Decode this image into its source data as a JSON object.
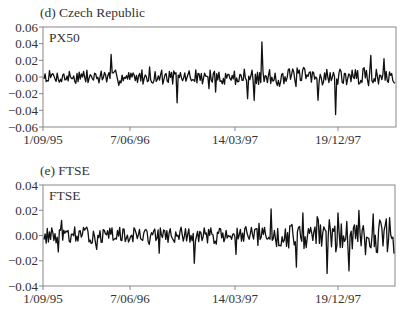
{
  "chart_data": [
    {
      "type": "line",
      "panel_title": "(d) Czech Republic",
      "series_label": "PX50",
      "xlabel": "",
      "ylabel": "",
      "x_tick_labels": [
        "1/09/95",
        "7/06/96",
        "14/03/97",
        "19/12/97"
      ],
      "y_tick_labels": [
        "0.06",
        "0.04",
        "0.02",
        "0.00",
        "−0.02",
        "−0.04",
        "−0.06"
      ],
      "ylim": [
        -0.06,
        0.06
      ],
      "x_range": [
        "1/09/95",
        "~08/1998"
      ],
      "grid": false,
      "legend": "inside top-left (series name)",
      "notes": "Daily returns series; mostly within ±0.015, spikes ~+0.027 (early 1996), ~-0.031 (mid 1996), ~+0.042 (mid 1997), ~-0.045 (early 1998)",
      "series": [
        {
          "name": "PX50",
          "amplitude": 0.008,
          "seed": 7,
          "spikes": [
            [
              0.19,
              0.027
            ],
            [
              0.38,
              -0.031
            ],
            [
              0.3,
              0.012
            ],
            [
              0.62,
              0.042
            ],
            [
              0.6,
              -0.028
            ],
            [
              0.58,
              -0.026
            ],
            [
              0.83,
              -0.045
            ],
            [
              0.78,
              -0.028
            ],
            [
              0.93,
              0.026
            ],
            [
              0.97,
              0.022
            ],
            [
              0.49,
              -0.018
            ],
            [
              0.47,
              -0.014
            ]
          ]
        }
      ]
    },
    {
      "type": "line",
      "panel_title": "(e) FTSE",
      "series_label": "FTSE",
      "xlabel": "",
      "ylabel": "",
      "x_tick_labels": [
        "1/09/95",
        "7/06/96",
        "14/03/97",
        "19/12/97"
      ],
      "y_tick_labels": [
        "0.04",
        "0.02",
        "0.00",
        "−0.02",
        "−0.04"
      ],
      "ylim": [
        -0.04,
        0.04
      ],
      "x_range": [
        "1/09/95",
        "~08/1998"
      ],
      "grid": false,
      "legend": "inside top-left (series name)",
      "notes": "Daily returns series; volatility increases in late 1997-1998, spikes ~+0.02 and ~-0.03",
      "series": [
        {
          "name": "FTSE",
          "amplitude": 0.006,
          "seed": 13,
          "spikes": [
            [
              0.05,
              0.012
            ],
            [
              0.04,
              -0.013
            ],
            [
              0.15,
              -0.011
            ],
            [
              0.33,
              -0.014
            ],
            [
              0.43,
              -0.022
            ],
            [
              0.55,
              -0.015
            ],
            [
              0.65,
              0.021
            ],
            [
              0.72,
              -0.025
            ],
            [
              0.74,
              0.018
            ],
            [
              0.81,
              -0.03
            ],
            [
              0.84,
              0.018
            ],
            [
              0.87,
              -0.028
            ],
            [
              0.9,
              0.02
            ],
            [
              0.94,
              0.017
            ],
            [
              0.78,
              0.015
            ]
          ]
        }
      ]
    }
  ]
}
